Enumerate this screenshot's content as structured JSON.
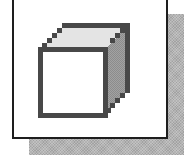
{
  "icon": {
    "name": "cube-icon",
    "description": "3D box / cube icon in a framed tile with drop shadow"
  },
  "colors": {
    "frame_border": "#1e1e1e",
    "frame_fill": "#ffffff",
    "shadow": "#b4b4b4",
    "cube_outline": "#484848",
    "cube_front": "#ffffff",
    "cube_top": "#e4e4e4",
    "cube_side": "#9a9a9a"
  }
}
